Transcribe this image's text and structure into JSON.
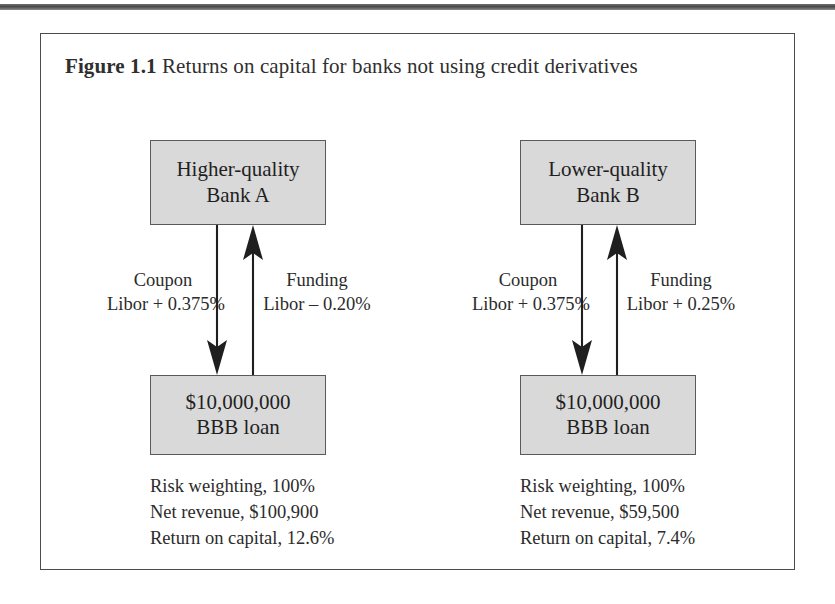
{
  "figure": {
    "label": "Figure 1.1",
    "caption": "Returns on capital for banks not using credit derivatives",
    "frame_border_color": "#4c4c4c",
    "box_fill_color": "#d9d9d9",
    "box_border_color": "#5a5a5a",
    "text_color": "#2b2b2b"
  },
  "left_panel": {
    "bank": {
      "line1": "Higher-quality",
      "line2": "Bank A"
    },
    "loan": {
      "line1": "$10,000,000",
      "line2": "BBB loan"
    },
    "coupon": {
      "title": "Coupon",
      "rate": "Libor + 0.375%"
    },
    "funding": {
      "title": "Funding",
      "rate": "Libor – 0.20%"
    },
    "stats": [
      "Risk weighting, 100%",
      "Net revenue, $100,900",
      "Return on capital, 12.6%"
    ]
  },
  "right_panel": {
    "bank": {
      "line1": "Lower-quality",
      "line2": "Bank B"
    },
    "loan": {
      "line1": "$10,000,000",
      "line2": "BBB loan"
    },
    "coupon": {
      "title": "Coupon",
      "rate": "Libor + 0.375%"
    },
    "funding": {
      "title": "Funding",
      "rate": "Libor + 0.25%"
    },
    "stats": [
      "Risk weighting, 100%",
      "Net revenue, $59,500",
      "Return on capital, 7.4%"
    ]
  }
}
